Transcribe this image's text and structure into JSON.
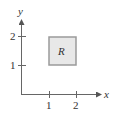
{
  "diagram": {
    "x_axis_label": "x",
    "y_axis_label": "y",
    "x_ticks": [
      {
        "value": 1,
        "label": "1"
      },
      {
        "value": 2,
        "label": "2"
      }
    ],
    "y_ticks": [
      {
        "value": 1,
        "label": "1"
      },
      {
        "value": 2,
        "label": "2"
      }
    ],
    "region": {
      "label": "R",
      "x_range": [
        1,
        2
      ],
      "y_range": [
        1,
        2
      ],
      "fill": "#e8e8e8",
      "stroke": "#9a9a9a"
    },
    "axis_color": "#666666"
  }
}
